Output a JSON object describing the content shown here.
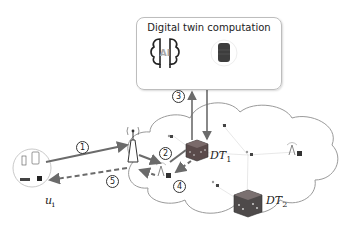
{
  "diagram": {
    "computation_box": {
      "title": "Digital twin computation",
      "icons": [
        "ai-brain-icon",
        "server-icon"
      ],
      "ai_text": "AI"
    },
    "user": {
      "label_main": "u",
      "label_sub": "i",
      "devices": [
        "phone-icon",
        "tablet-icon",
        "router-icon",
        "device-icon"
      ]
    },
    "digital_twins": [
      {
        "label_main": "DT",
        "label_sub": "1"
      },
      {
        "label_main": "DT",
        "label_sub": "2"
      }
    ],
    "steps": [
      {
        "id": "1",
        "label": "1",
        "from": "user",
        "to": "base-station",
        "style": "solid"
      },
      {
        "id": "2",
        "label": "2",
        "from": "base-station",
        "to": "edge-node",
        "style": "solid"
      },
      {
        "id": "3",
        "label": "3",
        "from": "DT1",
        "to": "computation",
        "style": "solid-bidirectional"
      },
      {
        "id": "4",
        "label": "4",
        "from": "DT1",
        "to": "edge-node",
        "style": "dashed"
      },
      {
        "id": "5",
        "label": "5",
        "from": "base-station",
        "to": "user",
        "style": "dashed"
      }
    ],
    "colors": {
      "arrow": "#6b6b6b",
      "cloud_stroke": "#9a9a9a",
      "cube_dark": "#4a4a4a",
      "box_border": "#bdbdbd"
    }
  }
}
